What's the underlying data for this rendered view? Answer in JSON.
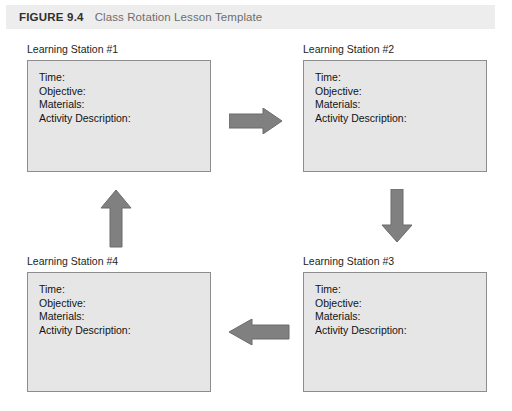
{
  "figure": {
    "number": "FIGURE 9.4",
    "title": "Class Rotation Lesson Template",
    "header_bg": "#ededed",
    "number_color": "#2f2f2f",
    "title_color": "#6e6e6e"
  },
  "style": {
    "box_fill": "#e6e6e6",
    "box_border": "#8d8d8d",
    "arrow_fill": "#808080",
    "arrow_stroke": "#6b6b6b",
    "text_color": "#131313",
    "page_bg": "#ffffff"
  },
  "fields": [
    "Time:",
    "Objective:",
    "Materials:",
    "Activity Description:"
  ],
  "stations": [
    {
      "id": "station-1",
      "label": "Learning Station #1",
      "fields": [
        "Time:",
        "Objective:",
        "Materials:",
        "Activity Description:"
      ]
    },
    {
      "id": "station-2",
      "label": "Learning Station #2",
      "fields": [
        "Time:",
        "Objective:",
        "Materials:",
        "Activity Description:"
      ]
    },
    {
      "id": "station-3",
      "label": "Learning Station #3",
      "fields": [
        "Time:",
        "Objective:",
        "Materials:",
        "Activity Description:"
      ]
    },
    {
      "id": "station-4",
      "label": "Learning Station #4",
      "fields": [
        "Time:",
        "Objective:",
        "Materials:",
        "Activity Description:"
      ]
    }
  ],
  "arrows": [
    {
      "id": "arrow-right",
      "direction": "right",
      "from": "Learning Station #1",
      "to": "Learning Station #2"
    },
    {
      "id": "arrow-down",
      "direction": "down",
      "from": "Learning Station #2",
      "to": "Learning Station #3"
    },
    {
      "id": "arrow-left",
      "direction": "left",
      "from": "Learning Station #3",
      "to": "Learning Station #4"
    },
    {
      "id": "arrow-up",
      "direction": "up",
      "from": "Learning Station #4",
      "to": "Learning Station #1"
    }
  ]
}
